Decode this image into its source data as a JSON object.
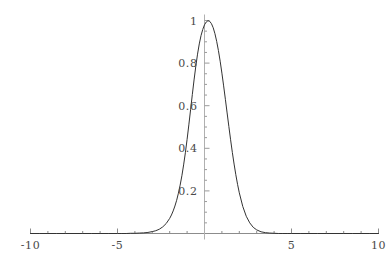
{
  "chart_data": {
    "type": "line",
    "title": "",
    "subtitle": "",
    "xlabel": "",
    "ylabel": "",
    "xlim": [
      -10,
      10
    ],
    "ylim": [
      0,
      1.05
    ],
    "grid": false,
    "legend": null,
    "axes_style": "mathematica-crossed-axes",
    "x_ticks_major": [
      -10,
      -5,
      5,
      10
    ],
    "x_tick_labels": [
      "-10",
      "-5",
      "5",
      "10"
    ],
    "x_ticks_minor_step": 1,
    "y_ticks_major": [
      0.2,
      0.4,
      0.6,
      0.8,
      1
    ],
    "y_tick_labels": [
      "0.2",
      "0.4",
      "0.6",
      "0.8",
      "1"
    ],
    "y_ticks_minor_step": 0.05,
    "series": [
      {
        "name": "bell-curve",
        "color": "#333333",
        "line_width": 1,
        "x": [
          -10,
          -9.5,
          -9,
          -8.5,
          -8,
          -7.5,
          -7,
          -6.5,
          -6,
          -5.5,
          -5,
          -4.75,
          -4.5,
          -4.25,
          -4,
          -3.75,
          -3.5,
          -3.25,
          -3,
          -2.8,
          -2.6,
          -2.4,
          -2.2,
          -2,
          -1.9,
          -1.8,
          -1.7,
          -1.6,
          -1.5,
          -1.4,
          -1.3,
          -1.2,
          -1.1,
          -1,
          -0.9,
          -0.8,
          -0.7,
          -0.6,
          -0.5,
          -0.4,
          -0.3,
          -0.2,
          -0.1,
          0,
          0.1,
          0.2,
          0.3,
          0.4,
          0.5,
          0.6,
          0.7,
          0.8,
          0.9,
          1,
          1.1,
          1.2,
          1.3,
          1.4,
          1.5,
          1.6,
          1.7,
          1.8,
          1.9,
          2,
          2.2,
          2.4,
          2.6,
          2.8,
          3,
          3.25,
          3.5,
          3.75,
          4,
          4.25,
          4.5,
          4.75,
          5,
          5.5,
          6,
          6.5,
          7,
          7.5,
          8,
          8.5,
          9,
          9.5,
          10
        ],
        "y": [
          0.0,
          0.0,
          0.0,
          0.0,
          0.0,
          0.0,
          0.0,
          0.0,
          0.0,
          0.0,
          0.0,
          0.0,
          0.0,
          0.001,
          0.001,
          0.002,
          0.003,
          0.005,
          0.009,
          0.013,
          0.02,
          0.031,
          0.047,
          0.071,
          0.087,
          0.106,
          0.129,
          0.156,
          0.189,
          0.227,
          0.271,
          0.322,
          0.379,
          0.442,
          0.51,
          0.581,
          0.652,
          0.721,
          0.785,
          0.842,
          0.89,
          0.929,
          0.958,
          0.98,
          0.993,
          0.999,
          0.996,
          0.985,
          0.966,
          0.938,
          0.902,
          0.859,
          0.809,
          0.753,
          0.693,
          0.63,
          0.566,
          0.502,
          0.44,
          0.381,
          0.326,
          0.276,
          0.231,
          0.191,
          0.127,
          0.081,
          0.05,
          0.029,
          0.017,
          0.008,
          0.004,
          0.002,
          0.001,
          0.0,
          0.0,
          0.0,
          0.0,
          0.0,
          0.0,
          0.0,
          0.0,
          0.0,
          0.0,
          0.0,
          0.0,
          0.0,
          0.0
        ]
      }
    ]
  },
  "plot": {
    "axis_color": "#8c8c8c",
    "curve_color": "#333333",
    "label_color": "#4a4a4a",
    "background": "#ffffff"
  }
}
